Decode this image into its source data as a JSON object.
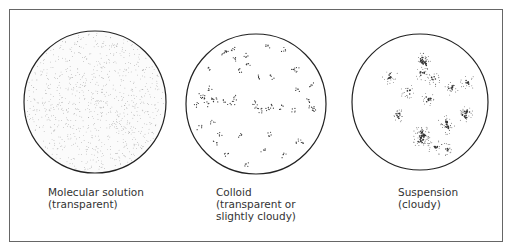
{
  "figure": {
    "panels": [
      {
        "id": "molecular-solution",
        "title": "Molecular solution",
        "lines": [
          "Molecular solution",
          "(transparent)"
        ]
      },
      {
        "id": "colloid",
        "title": "Colloid",
        "lines": [
          "Colloid",
          "(transparent or",
          "slightly cloudy)"
        ]
      },
      {
        "id": "suspension",
        "title": "Suspension",
        "lines": [
          "Suspension",
          "(cloudy)"
        ]
      }
    ]
  }
}
